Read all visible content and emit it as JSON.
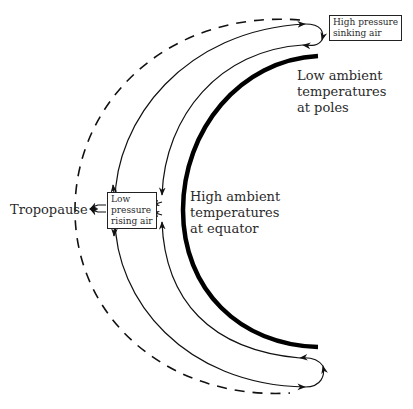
{
  "diagram": {
    "labels": {
      "tropopause": "Tropopause",
      "high_temp": [
        "High ambient",
        "temperatures",
        "at equator"
      ],
      "low_temp": [
        "Low ambient",
        "temperatures",
        "at poles"
      ]
    },
    "boxes": {
      "high_pressure": [
        "High pressure",
        "sinking air"
      ],
      "low_pressure": [
        "Low",
        "pressure",
        "rising air"
      ]
    },
    "colors": {
      "line": "#111111",
      "background": "#ffffff"
    }
  }
}
